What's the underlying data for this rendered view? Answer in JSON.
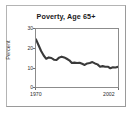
{
  "chart_data": {
    "type": "line",
    "title": "Poverty, Age 65+",
    "xlabel": "",
    "ylabel": "Percent",
    "xlim": [
      1970,
      2002
    ],
    "ylim": [
      0,
      30
    ],
    "ytick_labels": [
      "30",
      "20",
      "10",
      "0"
    ],
    "ytick_values": [
      30,
      20,
      10,
      0
    ],
    "xtick_labels": [
      "1970",
      "2002"
    ],
    "xtick_values": [
      1970,
      2002
    ],
    "grid": false,
    "legend": false,
    "line_color": "#3a3a3a",
    "series": [
      {
        "name": "Poverty rate, age 65 and over",
        "x": [
          1970,
          1971,
          1972,
          1973,
          1974,
          1975,
          1976,
          1977,
          1978,
          1979,
          1980,
          1981,
          1982,
          1983,
          1984,
          1985,
          1986,
          1987,
          1988,
          1989,
          1990,
          1991,
          1992,
          1993,
          1994,
          1995,
          1996,
          1997,
          1998,
          1999,
          2000,
          2001,
          2002
        ],
        "values": [
          24.6,
          21.6,
          18.6,
          16.3,
          14.6,
          15.3,
          15.0,
          14.1,
          14.0,
          15.2,
          15.7,
          15.3,
          14.6,
          13.8,
          12.4,
          12.6,
          12.4,
          12.5,
          12.0,
          11.4,
          12.2,
          12.4,
          12.9,
          12.2,
          11.7,
          10.5,
          10.8,
          10.5,
          10.5,
          9.7,
          10.2,
          10.1,
          10.4
        ]
      }
    ]
  },
  "figure": {
    "title": "Poverty, Age 65+",
    "y_axis_label": "Percent",
    "y_ticks": [
      "30",
      "20",
      "10",
      "0"
    ],
    "x_ticks": [
      "1970",
      "2002"
    ]
  }
}
